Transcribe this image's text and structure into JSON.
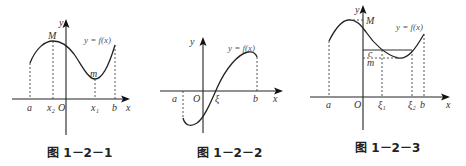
{
  "figures": [
    {
      "id": "fig1",
      "caption": "图 1－2－1",
      "function_label": "y = f(x)",
      "axis_labels": {
        "x": "x",
        "y": "y",
        "origin": "O"
      },
      "point_labels": {
        "max": "M",
        "min": "m"
      },
      "x_ticks": [
        "a",
        "x₂",
        "x₁",
        "b"
      ]
    },
    {
      "id": "fig2",
      "caption": "图 1－2－2",
      "function_label": "y = f(x)",
      "axis_labels": {
        "x": "x",
        "y": "y",
        "origin": "O"
      },
      "x_ticks": [
        "a",
        "ξ",
        "b"
      ]
    },
    {
      "id": "fig3",
      "caption": "图 1－2－3",
      "function_label": "y = f(x)",
      "axis_labels": {
        "x": "x",
        "y": "y",
        "origin": "O"
      },
      "y_labels": {
        "max": "M",
        "level": "c",
        "min": "m"
      },
      "x_ticks": [
        "a",
        "ξ₁",
        "ξ₂",
        "b"
      ]
    }
  ]
}
